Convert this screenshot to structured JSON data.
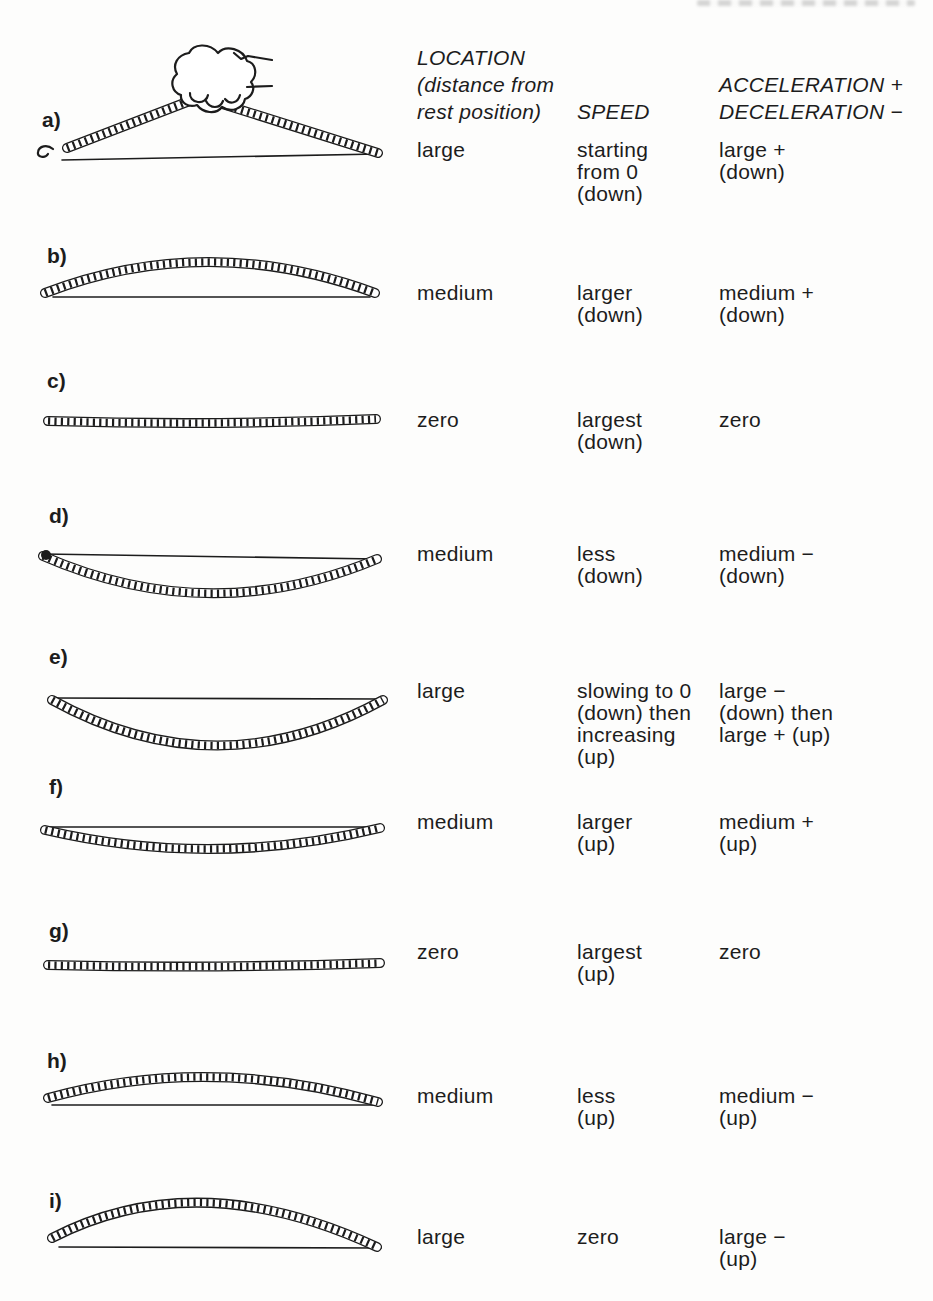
{
  "accent": {
    "ink": "#1c1c1c",
    "paper": "#fdfdfc"
  },
  "header": {
    "location_title": [
      "LOCATION",
      "(distance from",
      "rest position)"
    ],
    "speed_title": "SPEED",
    "acceleration_title": [
      "ACCELERATION +",
      "DECELERATION −"
    ]
  },
  "rows": [
    {
      "label": "a)",
      "figure": "ruler-bent-up-peak-pinched-by-hand-above-rest-line",
      "location": "large",
      "speed": [
        "starting",
        "from 0",
        "(down)"
      ],
      "acceleration": [
        "large +",
        "(down)"
      ]
    },
    {
      "label": "b)",
      "figure": "ruler-arched-up-medium-above-rest-line",
      "location": "medium",
      "speed": [
        "larger",
        "(down)"
      ],
      "acceleration": [
        "medium +",
        "(down)"
      ]
    },
    {
      "label": "c)",
      "figure": "ruler-flat-at-rest-position",
      "location": "zero",
      "speed": [
        "largest",
        "(down)"
      ],
      "acceleration": [
        "zero"
      ]
    },
    {
      "label": "d)",
      "figure": "ruler-bowed-down-medium-below-rest-line",
      "location": "medium",
      "speed": [
        "less",
        "(down)"
      ],
      "acceleration": [
        "medium −",
        "(down)"
      ]
    },
    {
      "label": "e)",
      "figure": "ruler-bowed-down-large-below-rest-line",
      "location": "large",
      "speed": [
        "slowing to 0",
        "(down) then",
        "increasing",
        "(up)"
      ],
      "acceleration": [
        "large −",
        "(down) then",
        "large + (up)"
      ]
    },
    {
      "label": "f)",
      "figure": "ruler-bowed-down-slight-below-rest-line-moving-up",
      "location": "medium",
      "speed": [
        "larger",
        "(up)"
      ],
      "acceleration": [
        "medium +",
        "(up)"
      ]
    },
    {
      "label": "g)",
      "figure": "ruler-flat-at-rest-position-moving-up",
      "location": "zero",
      "speed": [
        "largest",
        "(up)"
      ],
      "acceleration": [
        "zero"
      ]
    },
    {
      "label": "h)",
      "figure": "ruler-arched-up-medium-above-rest-line-moving-up",
      "location": "medium",
      "speed": [
        "less",
        "(up)"
      ],
      "acceleration": [
        "medium −",
        "(up)"
      ]
    },
    {
      "label": "i)",
      "figure": "ruler-arched-up-large-above-rest-line",
      "location": "large",
      "speed": [
        "zero"
      ],
      "acceleration": [
        "large −",
        "(up)"
      ]
    }
  ]
}
